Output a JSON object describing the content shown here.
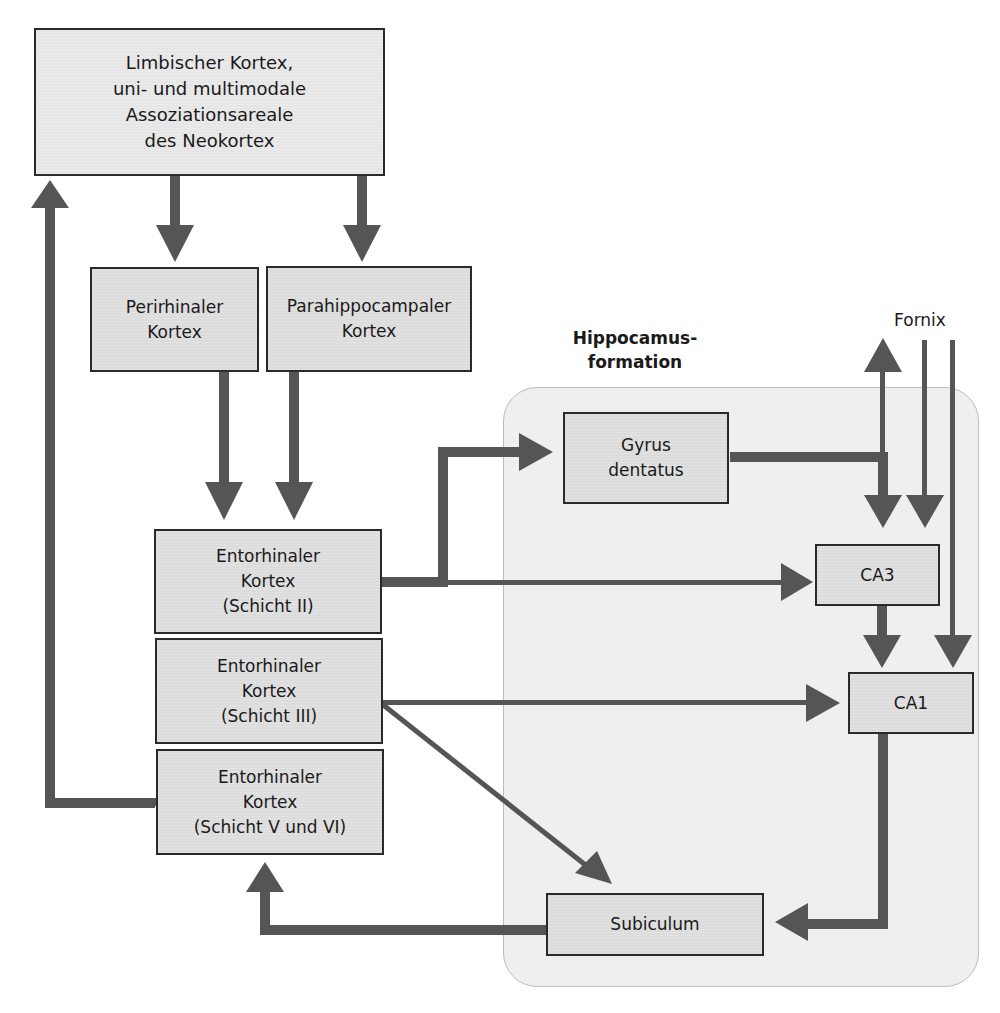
{
  "diagram": {
    "region": {
      "label": "Hippocamus-\nformation"
    },
    "fornix_label": "Fornix",
    "nodes": {
      "neocortex": "Limbischer Kortex,\nuni- und multimodale\nAssoziationsareale\ndes Neokortex",
      "perirhinal": "Perirhinaler\nKortex",
      "parahippocampal": "Parahippocampaler\nKortex",
      "ec_layer2": "Entorhinaler\nKortex\n(Schicht II)",
      "ec_layer3": "Entorhinaler\nKortex\n(Schicht III)",
      "ec_layer56": "Entorhinaler\nKortex\n(Schicht V und VI)",
      "dentate": "Gyrus\ndentatus",
      "ca3": "CA3",
      "ca1": "CA1",
      "subiculum": "Subiculum"
    },
    "edges": [
      {
        "from": "neocortex",
        "to": "perirhinal"
      },
      {
        "from": "neocortex",
        "to": "parahippocampal"
      },
      {
        "from": "neocortex",
        "to": "ec_layer2"
      },
      {
        "from": "perirhinal",
        "to": "ec_layer2"
      },
      {
        "from": "parahippocampal",
        "to": "ec_layer2"
      },
      {
        "from": "ec_layer2",
        "to": "dentate"
      },
      {
        "from": "ec_layer2",
        "to": "ca3"
      },
      {
        "from": "dentate",
        "to": "ca3"
      },
      {
        "from": "dentate",
        "to": "fornix"
      },
      {
        "from": "fornix",
        "to": "ca3"
      },
      {
        "from": "fornix",
        "to": "ca1"
      },
      {
        "from": "ca3",
        "to": "ca1"
      },
      {
        "from": "ec_layer3",
        "to": "ca1"
      },
      {
        "from": "ec_layer3",
        "to": "subiculum"
      },
      {
        "from": "ca1",
        "to": "subiculum"
      },
      {
        "from": "subiculum",
        "to": "ec_layer56"
      },
      {
        "from": "ec_layer56",
        "to": "neocortex"
      }
    ],
    "colors": {
      "arrow": "#555555",
      "box_fill": "#dcdcdc",
      "region_fill": "#efefef"
    }
  }
}
